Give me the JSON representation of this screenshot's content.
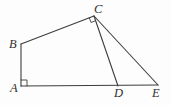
{
  "figure": {
    "width": 171,
    "height": 105,
    "background": "#fdfdfd",
    "stroke_color": "#3d3d3d",
    "stroke_width": 1.1,
    "mark_stroke_width": 0.9,
    "points": {
      "A": {
        "x": 21,
        "y": 86,
        "label": "A",
        "label_x": 10,
        "label_y": 92
      },
      "B": {
        "x": 21,
        "y": 44,
        "label": "B",
        "label_x": 9,
        "label_y": 48
      },
      "C": {
        "x": 94,
        "y": 16,
        "label": "C",
        "label_x": 94,
        "label_y": 13
      },
      "D": {
        "x": 118,
        "y": 86,
        "label": "D",
        "label_x": 114,
        "label_y": 97
      },
      "E": {
        "x": 158,
        "y": 85,
        "label": "E",
        "label_x": 152,
        "label_y": 97
      }
    },
    "segments": [
      {
        "name": "segment-AB",
        "from": "A",
        "to": "B"
      },
      {
        "name": "segment-BC",
        "from": "B",
        "to": "C"
      },
      {
        "name": "segment-CD",
        "from": "C",
        "to": "D"
      },
      {
        "name": "segment-CE",
        "from": "C",
        "to": "E"
      },
      {
        "name": "segment-AE",
        "from": "A",
        "to": "E"
      }
    ],
    "right_angle_marks": [
      {
        "name": "right-angle-mark-at-A",
        "points": "21,80 27,80 27,86"
      },
      {
        "name": "right-angle-mark-at-C",
        "points": "89.3,17.8 91.0,22.5 95.6,20.7"
      }
    ]
  }
}
